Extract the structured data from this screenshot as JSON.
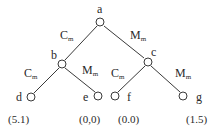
{
  "diagram": {
    "type": "game-tree",
    "nodes": {
      "a": {
        "label": "a"
      },
      "b": {
        "label": "b"
      },
      "c": {
        "label": "c"
      },
      "d": {
        "label": "d"
      },
      "e": {
        "label": "e"
      },
      "f": {
        "label": "f"
      },
      "g": {
        "label": "g"
      }
    },
    "edges": [
      {
        "from": "a",
        "to": "b",
        "label": "C",
        "sub": "m"
      },
      {
        "from": "a",
        "to": "c",
        "label": "M",
        "sub": "m"
      },
      {
        "from": "b",
        "to": "d",
        "label": "C",
        "sub": "m"
      },
      {
        "from": "b",
        "to": "e",
        "label": "M",
        "sub": "m"
      },
      {
        "from": "c",
        "to": "f",
        "label": "C",
        "sub": "m"
      },
      {
        "from": "c",
        "to": "g",
        "label": "M",
        "sub": "m"
      }
    ],
    "payoffs": {
      "d": "(5.1)",
      "e": "(0,0)",
      "f": "(0.0)",
      "g": "(1.5)"
    },
    "colors": {
      "line": "#3a3a3a",
      "text": "#2a2a2a"
    }
  }
}
